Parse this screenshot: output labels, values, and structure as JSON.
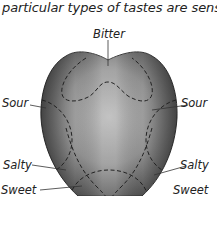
{
  "caption": "particular types of tastes are sensed.",
  "labels": {
    "bitter": "Bitter",
    "sour_left": "Sour",
    "sour_right": "Sour",
    "salty_left": "Salty",
    "salty_right": "Salty",
    "sweet_left": "Sweet",
    "sweet_right": "Sweet"
  },
  "colors": {
    "tongue_center": "#b0b0b0",
    "tongue_edge": "#555555",
    "outline": "#333333"
  }
}
